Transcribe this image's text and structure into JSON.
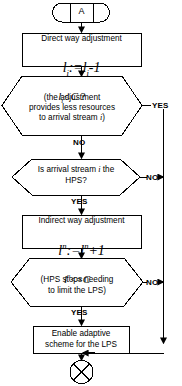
{
  "diagram": {
    "line_color": "#000000",
    "fill_color": "#ffffff",
    "background": "#ffffff"
  },
  "nodes": {
    "connector_a": {
      "shape": "off-page-connector",
      "label": "A"
    },
    "process_direct": {
      "shape": "process",
      "title": "Direct way adjustment",
      "formula": "lᵢ:=lᵢ-1",
      "formula_var": "l",
      "formula_sub": "i",
      "formula_tail": ":=",
      "formula_rhs_tail": "-1"
    },
    "decision_li_lt_c": {
      "shape": "hexagon-decision",
      "condition": "lᵢ<C ?",
      "note_line1": "(the adjustment",
      "note_line2": "provides less resources",
      "note_line3": "to arrival stream i)"
    },
    "decision_hps": {
      "shape": "hexagon-decision",
      "text_line1": "Is arrival stream i the",
      "text_line2": "HPS?"
    },
    "process_indirect": {
      "shape": "process",
      "title": "Indirect way adjustment",
      "formula": "lⁿ:=lⁿ+1"
    },
    "decision_ln_le_c": {
      "shape": "hexagon-decision",
      "condition": "lⁿ<=C",
      "note_line1": "(HPS stops needing",
      "note_line2": "to limit the LPS)"
    },
    "process_enable": {
      "shape": "process",
      "text_line1": "Enable adaptive",
      "text_line2": "scheme for the LPS"
    },
    "terminator_x": {
      "shape": "circle-cross-connector",
      "label": ""
    }
  },
  "edges": [
    {
      "id": "e-a-to-direct",
      "from": "connector_a",
      "to": "process_direct",
      "label": ""
    },
    {
      "id": "e-direct-to-dec1",
      "from": "process_direct",
      "to": "decision_li_lt_c",
      "label": ""
    },
    {
      "id": "e-dec1-yes",
      "from": "decision_li_lt_c",
      "to": "terminator_x",
      "label": "YES"
    },
    {
      "id": "e-dec1-no",
      "from": "decision_li_lt_c",
      "to": "decision_hps",
      "label": "NO"
    },
    {
      "id": "e-dec2-no",
      "from": "decision_hps",
      "to": "terminator_x",
      "label": "NO"
    },
    {
      "id": "e-dec2-yes",
      "from": "decision_hps",
      "to": "process_indirect",
      "label": "YES"
    },
    {
      "id": "e-indirect-to-dec3",
      "from": "process_indirect",
      "to": "decision_ln_le_c",
      "label": ""
    },
    {
      "id": "e-dec3-no",
      "from": "decision_ln_le_c",
      "to": "terminator_x",
      "label": "NO"
    },
    {
      "id": "e-dec3-yes",
      "from": "decision_ln_le_c",
      "to": "process_enable",
      "label": "YES"
    },
    {
      "id": "e-enable-to-end",
      "from": "process_enable",
      "to": "terminator_x",
      "label": ""
    }
  ],
  "edge_labels": {
    "yes_1": "YES",
    "no_1": "NO",
    "no_2": "NO",
    "yes_2": "YES",
    "no_3": "NO",
    "yes_3": "YES"
  }
}
